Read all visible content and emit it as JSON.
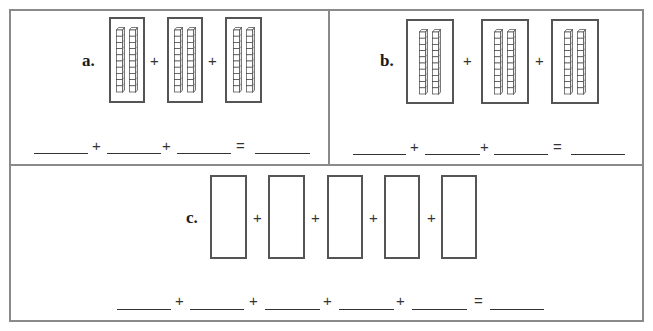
{
  "worksheet": {
    "problems": [
      {
        "label": "a.",
        "groups": [
          {
            "rods": 2,
            "cubes_per_rod": 10
          },
          {
            "rods": 2,
            "cubes_per_rod": 10
          },
          {
            "rods": 2,
            "cubes_per_rod": 10
          }
        ],
        "operator": "+",
        "equation": {
          "blanks": 4,
          "plus": "+",
          "equals": "="
        }
      },
      {
        "label": "b.",
        "groups": [
          {
            "rods": 3,
            "cubes_per_rod": 10
          },
          {
            "rods": 3,
            "cubes_per_rod": 10
          },
          {
            "rods": 3,
            "cubes_per_rod": 10
          }
        ],
        "operator": "+",
        "equation": {
          "blanks": 4,
          "plus": "+",
          "equals": "="
        }
      },
      {
        "label": "c.",
        "groups": [
          {
            "rods": 2,
            "cubes_per_rod": 10
          },
          {
            "rods": 2,
            "cubes_per_rod": 10
          },
          {
            "rods": 2,
            "cubes_per_rod": 10
          },
          {
            "rods": 2,
            "cubes_per_rod": 10
          },
          {
            "rods": 2,
            "cubes_per_rod": 10
          }
        ],
        "operator": "+",
        "equation": {
          "blanks": 6,
          "plus": "+",
          "equals": "="
        }
      }
    ],
    "colors": {
      "frame": "#8a8a8a",
      "box": "#555555",
      "ink": "#222222"
    }
  }
}
